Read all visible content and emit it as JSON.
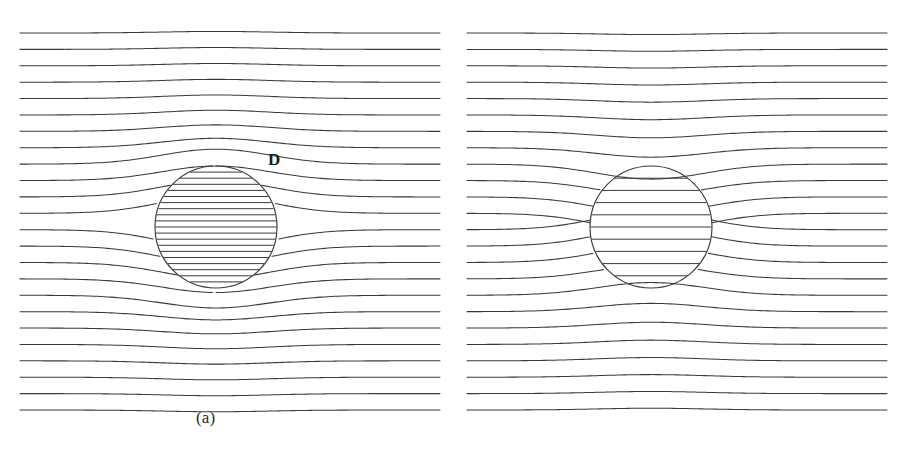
{
  "figure": {
    "background_color": "#ffffff",
    "line_color": "#3a3a3a",
    "width": 906,
    "height": 452
  },
  "panels": [
    {
      "id": "a",
      "caption": "(a)",
      "field_label": "D",
      "field_label_kind": "bold-roman",
      "description": "Displacement field D lines converge into the dielectric sphere",
      "sphere": {
        "cx": 216,
        "cy": 227,
        "r": 61
      },
      "interior_line_count": 19,
      "interior_density": "high",
      "bend_direction": "toward-sphere"
    },
    {
      "id": "b",
      "caption": "(b)",
      "field_label_epsilon": "ϵ",
      "field_label_subscript": "0",
      "field_label_vector": "E",
      "field_label": "ϵ0E",
      "field_label_kind": "math-italic-epsilon-bold-E",
      "description": "Field lines of epsilon-zero E are expelled from the dielectric sphere",
      "sphere": {
        "cx": 651,
        "cy": 227,
        "r": 61
      },
      "interior_line_count": 9,
      "interior_density": "low",
      "bend_direction": "away-from-sphere"
    }
  ],
  "chart_data": {
    "type": "line",
    "xlabel": "",
    "ylabel": "",
    "subtitle": "",
    "legend": [],
    "grid": false,
    "series": [
      {
        "name": "D field lines (panel a)",
        "count": 24,
        "y_start": 33,
        "y_end": 410,
        "x_range": [
          33,
          420
        ],
        "deflection": "lines pulled in toward sphere center (converging)"
      },
      {
        "name": "epsilon0 E field lines (panel b)",
        "count": 24,
        "y_start": 33,
        "y_end": 410,
        "x_range": [
          486,
          873
        ],
        "deflection": "lines pushed away from sphere (diverging)"
      }
    ],
    "annotations": [
      {
        "text": "D",
        "x": 276,
        "y": 160
      },
      {
        "text": "ϵ0E",
        "x": 760,
        "y": 163
      },
      {
        "text": "(a)",
        "x": 208,
        "y": 420
      },
      {
        "text": "(b)",
        "x": 658,
        "y": 420
      }
    ]
  }
}
